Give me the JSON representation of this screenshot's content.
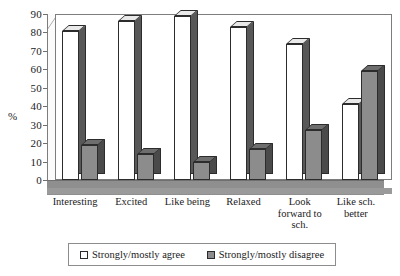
{
  "chart_data": {
    "type": "bar",
    "title": "",
    "subtitle": "",
    "xlabel": "",
    "ylabel": "%",
    "ylim": [
      0,
      90
    ],
    "ytick_step": 10,
    "yticks": [
      0,
      10,
      20,
      30,
      40,
      50,
      60,
      70,
      80,
      90
    ],
    "grid": false,
    "legend_position": "bottom",
    "style_3d": true,
    "categories": [
      "Interesting",
      "Excited",
      "Like being",
      "Relaxed",
      "Look\nforward to\nsch.",
      "Like sch.\nbetter"
    ],
    "series": [
      {
        "name": "Strongly/mostly agree",
        "color": "#ffffff",
        "values": [
          81,
          86,
          89,
          83,
          74,
          41
        ]
      },
      {
        "name": "Strongly/mostly disagree",
        "color": "#8c8c8c",
        "values": [
          19,
          14,
          10,
          17,
          27,
          59
        ]
      }
    ]
  },
  "legend": {
    "items": [
      {
        "label": "Strongly/mostly agree",
        "swatch": "agree"
      },
      {
        "label": "Strongly/mostly disagree",
        "swatch": "disagree"
      }
    ]
  }
}
